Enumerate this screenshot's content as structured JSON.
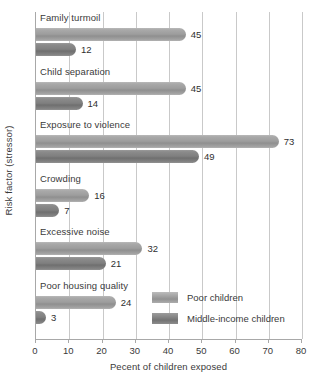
{
  "chart_data": {
    "type": "bar",
    "orientation": "horizontal",
    "title": "",
    "xlabel": "Pecent of children exposed",
    "ylabel": "Risk factor (stressor)",
    "xlim": [
      0,
      80
    ],
    "xticks": [
      0,
      10,
      20,
      30,
      40,
      50,
      60,
      70,
      80
    ],
    "xticklabels": [
      "0",
      "10",
      "20",
      "30",
      "40",
      "50",
      "60",
      "70",
      "80"
    ],
    "grid": "vertical",
    "legend_position": "inside-lower-right",
    "categories": [
      "Family turmoil",
      "Child separation",
      "Exposure to violence",
      "Crowding",
      "Excessive noise",
      "Poor housing quality"
    ],
    "series": [
      {
        "name": "Poor children",
        "color": "#9d9d9d",
        "values": [
          45,
          45,
          73,
          16,
          32,
          24
        ],
        "labels": [
          "45",
          "45",
          "73",
          "16",
          "32",
          "24"
        ]
      },
      {
        "name": "Middle-income children",
        "color": "#7f7f7f",
        "values": [
          12,
          14,
          49,
          7,
          21,
          3
        ],
        "labels": [
          "12",
          "14",
          "49",
          "7",
          "21",
          "3"
        ]
      }
    ]
  },
  "legend": {
    "entries": [
      {
        "label": "Poor children",
        "swatch": "poor"
      },
      {
        "label": "Middle-income children",
        "swatch": "middle"
      }
    ]
  }
}
